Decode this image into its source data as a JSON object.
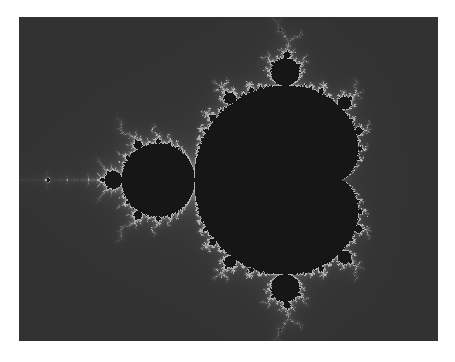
{
  "image": {
    "subject": "Mandelbrot set fractal",
    "background_color": "#ffffff",
    "frame": {
      "x": 19,
      "y": 17,
      "width": 419,
      "height": 324
    },
    "colors": {
      "set_interior": "#161616",
      "exterior_base": "#323232",
      "boundary_glow": "#b4b4b4"
    },
    "render": {
      "re_min": -1.955,
      "re_max": 0.923,
      "im_max": 1.12,
      "im_min": -1.106,
      "max_iterations": 200
    }
  }
}
